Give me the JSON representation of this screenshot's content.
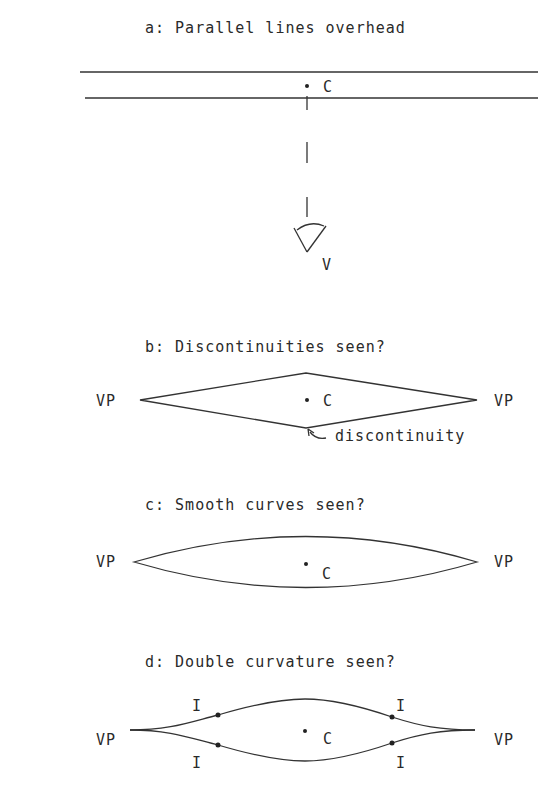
{
  "panels": {
    "a": {
      "title": "a:  Parallel lines overhead",
      "center_label": "C",
      "viewer_label": "V"
    },
    "b": {
      "title": "b:  Discontinuities seen?",
      "left_label": "VP",
      "right_label": "VP",
      "center_label": "C",
      "annotation": "discontinuity"
    },
    "c": {
      "title": "c:  Smooth curves seen?",
      "left_label": "VP",
      "right_label": "VP",
      "center_label": "C"
    },
    "d": {
      "title": "d:  Double curvature seen?",
      "left_label": "VP",
      "right_label": "VP",
      "center_label": "C",
      "inflection_label": "I"
    }
  }
}
